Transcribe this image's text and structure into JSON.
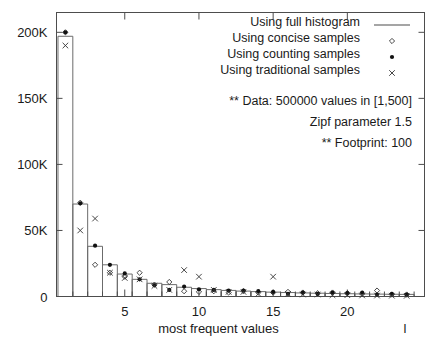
{
  "chart_data": {
    "type": "bar",
    "title": "",
    "xlabel": "most frequent values",
    "ylabel": "",
    "xlim": [
      0.4,
      25.2
    ],
    "ylim": [
      0,
      215000
    ],
    "grid": false,
    "legend_position": "top-right",
    "xticks": [
      5,
      10,
      15,
      20
    ],
    "xtick_labels": [
      "5",
      "10",
      "15",
      "20"
    ],
    "yticks": [
      0,
      50000,
      100000,
      150000,
      200000
    ],
    "ytick_labels": [
      "0",
      "50K",
      "100K",
      "150K",
      "200K"
    ],
    "categories": [
      1,
      2,
      3,
      4,
      5,
      6,
      7,
      8,
      9,
      10,
      11,
      12,
      13,
      14,
      15,
      16,
      17,
      18,
      19,
      20,
      21,
      22,
      23,
      24
    ],
    "series": [
      {
        "name": "Using full histogram",
        "marker": "line",
        "values": [
          197000,
          70000,
          38000,
          24000,
          17000,
          13000,
          10000,
          9000,
          7000,
          6000,
          5200,
          4600,
          4100,
          3700,
          3300,
          3000,
          2700,
          2500,
          2300,
          2100,
          1950,
          1800,
          1700,
          1600
        ]
      },
      {
        "name": "Using concise samples",
        "marker": "diamond",
        "values": [
          200000,
          71000,
          24000,
          18000,
          15000,
          18000,
          9000,
          11000,
          4000,
          3500,
          4000,
          3000,
          4000,
          3000,
          3000,
          3500,
          3000,
          2500,
          3000,
          2500,
          2000,
          4500,
          1500,
          1500
        ]
      },
      {
        "name": "Using counting samples",
        "marker": "dot",
        "values": [
          200000,
          70500,
          38500,
          24000,
          17500,
          13000,
          8500,
          5000,
          7500,
          5500,
          5000,
          4500,
          4500,
          4000,
          3500,
          2000,
          3000,
          2000,
          3000,
          2500,
          3000,
          1500,
          2000,
          1500
        ]
      },
      {
        "name": "Using traditional samples",
        "marker": "cross",
        "values": [
          190000,
          50000,
          59000,
          18000,
          14000,
          13000,
          8000,
          5000,
          20000,
          15000,
          5000,
          3500,
          3500,
          2000,
          15000,
          2000,
          1500,
          1500,
          1000,
          1000,
          800,
          700,
          600,
          500
        ]
      }
    ],
    "annotations": [
      "** Data: 500000 values in [1,500]",
      "Zipf parameter 1.5",
      "** Footprint: 100"
    ],
    "stray_mark": "l"
  }
}
